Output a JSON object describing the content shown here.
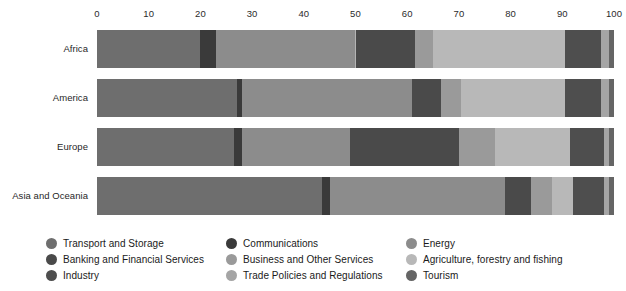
{
  "chart_data": {
    "type": "bar",
    "orientation": "horizontal",
    "stacked": true,
    "normalized_percent": true,
    "title": "",
    "subtitle": "",
    "xlabel": "",
    "ylabel": "",
    "xlim": [
      0,
      100
    ],
    "xticks": [
      0,
      10,
      20,
      30,
      40,
      50,
      60,
      70,
      80,
      90,
      100
    ],
    "xtick_labels": [
      "0",
      "10",
      "20",
      "30",
      "40",
      "50",
      "60",
      "70",
      "80",
      "90",
      "100"
    ],
    "grid": false,
    "legend_position": "bottom",
    "legend_columns": 3,
    "categories": [
      "Africa",
      "America",
      "Europe",
      "Asia and Oceania"
    ],
    "series": [
      {
        "name": "Transport and Storage",
        "color": "#6e6e6e",
        "values": [
          20.0,
          27.0,
          26.5,
          43.5
        ]
      },
      {
        "name": "Communications",
        "color": "#3a3a3a",
        "values": [
          3.0,
          1.0,
          1.5,
          1.5
        ]
      },
      {
        "name": "Energy",
        "color": "#8c8c8c",
        "values": [
          27.0,
          33.0,
          21.0,
          34.0
        ]
      },
      {
        "name": "Banking and Financial Services",
        "color": "#4a4a4a",
        "values": [
          11.5,
          5.5,
          21.0,
          5.0
        ]
      },
      {
        "name": "Business and Other Services",
        "color": "#9a9a9a",
        "values": [
          3.5,
          4.0,
          7.0,
          4.0
        ]
      },
      {
        "name": "Agriculture, forestry and fishing",
        "color": "#b8b8b8",
        "values": [
          25.5,
          20.0,
          14.5,
          4.0
        ]
      },
      {
        "name": "Industry",
        "color": "#4e4e4e",
        "values": [
          7.0,
          7.0,
          6.5,
          6.0
        ]
      },
      {
        "name": "Trade Policies and Regulations",
        "color": "#a5a5a5",
        "values": [
          1.5,
          1.5,
          1.0,
          1.0
        ]
      },
      {
        "name": "Tourism",
        "color": "#656565",
        "values": [
          1.0,
          1.0,
          1.0,
          1.0
        ]
      }
    ]
  },
  "legend": {
    "columns": [
      [
        {
          "label": "Transport and Storage",
          "color": "#6e6e6e"
        },
        {
          "label": "Banking and Financial Services",
          "color": "#4a4a4a"
        },
        {
          "label": "Industry",
          "color": "#4e4e4e"
        }
      ],
      [
        {
          "label": "Communications",
          "color": "#3a3a3a"
        },
        {
          "label": "Business and Other Services",
          "color": "#9a9a9a"
        },
        {
          "label": "Trade Policies and Regulations",
          "color": "#a5a5a5"
        }
      ],
      [
        {
          "label": "Energy",
          "color": "#8c8c8c"
        },
        {
          "label": "Agriculture, forestry and fishing",
          "color": "#b8b8b8"
        },
        {
          "label": "Tourism",
          "color": "#656565"
        }
      ]
    ]
  },
  "colors": {
    "background": "#ffffff",
    "text": "#1a1a1a",
    "tick_text": "#2b2b2b"
  }
}
